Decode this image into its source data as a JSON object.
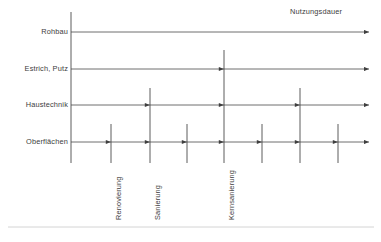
{
  "figure": {
    "top_annotation": "Nutzungsdauer",
    "line_color": "#4a4a4a",
    "text_color": "#3d3d3d",
    "background": "#ffffff",
    "footer_rule_color": "#c9c9c9"
  },
  "axis": {
    "x": 71,
    "y_top": 12,
    "y_bottom": 163,
    "x_end": 369
  },
  "rows": [
    {
      "label": "Rohbau",
      "y": 32,
      "arrow_positions": []
    },
    {
      "label": "Estrich, Putz",
      "y": 69,
      "arrow_positions": [
        224
      ]
    },
    {
      "label": "Haustechnik",
      "y": 105,
      "arrow_positions": [
        150,
        224,
        300
      ]
    },
    {
      "label": "Oberflächen",
      "y": 142,
      "arrow_positions": [
        111,
        150,
        187,
        224,
        262,
        300,
        338
      ]
    }
  ],
  "verticals": [
    {
      "x": 111,
      "y_top": 124,
      "y_bottom": 163,
      "label": "Renovierung",
      "label_y": 168
    },
    {
      "x": 150,
      "y_top": 88,
      "y_bottom": 163,
      "label": "Sanierung",
      "label_y": 168
    },
    {
      "x": 187,
      "y_top": 124,
      "y_bottom": 163,
      "label": "",
      "label_y": 0
    },
    {
      "x": 224,
      "y_top": 50,
      "y_bottom": 163,
      "label": "Kernsanierung",
      "label_y": 168
    },
    {
      "x": 262,
      "y_top": 124,
      "y_bottom": 163,
      "label": "",
      "label_y": 0
    },
    {
      "x": 300,
      "y_top": 88,
      "y_bottom": 163,
      "label": "",
      "label_y": 0
    },
    {
      "x": 338,
      "y_top": 124,
      "y_bottom": 163,
      "label": "",
      "label_y": 0
    }
  ],
  "footer_rule": {
    "x1": 8,
    "x2": 374,
    "y": 227
  }
}
